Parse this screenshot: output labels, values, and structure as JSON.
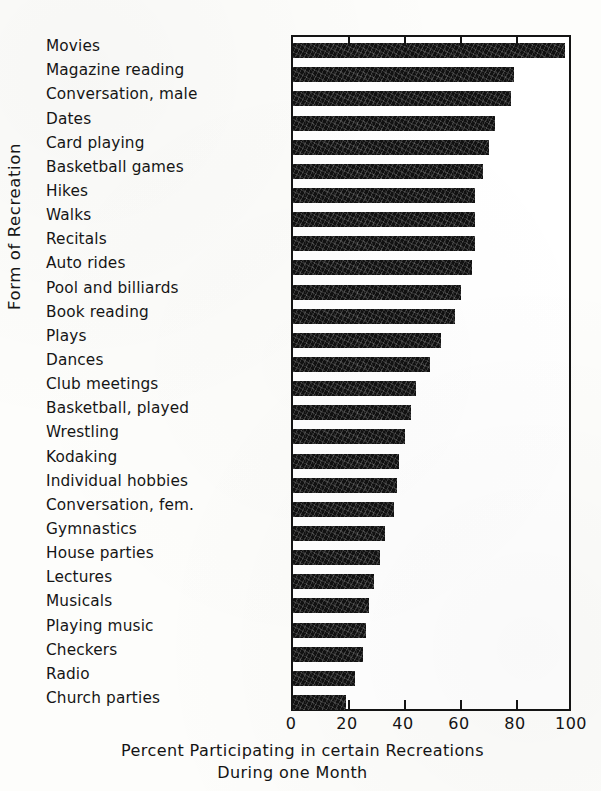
{
  "chart_data": {
    "type": "bar",
    "orientation": "horizontal",
    "title": "",
    "caption_line1": "Percent Participating in certain Recreations",
    "caption_line2": "During one Month",
    "xlabel": "Percent Participating in certain Recreations During one Month",
    "ylabel": "Form of Recreation",
    "xlim": [
      0,
      100
    ],
    "xticks": [
      0,
      20,
      40,
      60,
      80,
      100
    ],
    "xtick_labels": [
      "0",
      "20",
      "40",
      "60",
      "80",
      "100"
    ],
    "grid": false,
    "legend": null,
    "bar_color": "#111111",
    "frame_color": "#141414",
    "categories": [
      "Movies",
      "Magazine reading",
      "Conversation, male",
      "Dates",
      "Card playing",
      "Basketball games",
      "Hikes",
      "Walks",
      "Recitals",
      "Auto rides",
      "Pool and billiards",
      "Book reading",
      "Plays",
      "Dances",
      "Club meetings",
      "Basketball, played",
      "Wrestling",
      "Kodaking",
      "Individual hobbies",
      "Conversation, fem.",
      "Gymnastics",
      "House parties",
      "Lectures",
      "Musicals",
      "Playing music",
      "Checkers",
      "Radio",
      "Church parties"
    ],
    "values": [
      97,
      79,
      78,
      72,
      70,
      68,
      65,
      65,
      65,
      64,
      60,
      58,
      53,
      49,
      44,
      42,
      40,
      38,
      37,
      36,
      33,
      31,
      29,
      27,
      26,
      25,
      22,
      19
    ]
  }
}
